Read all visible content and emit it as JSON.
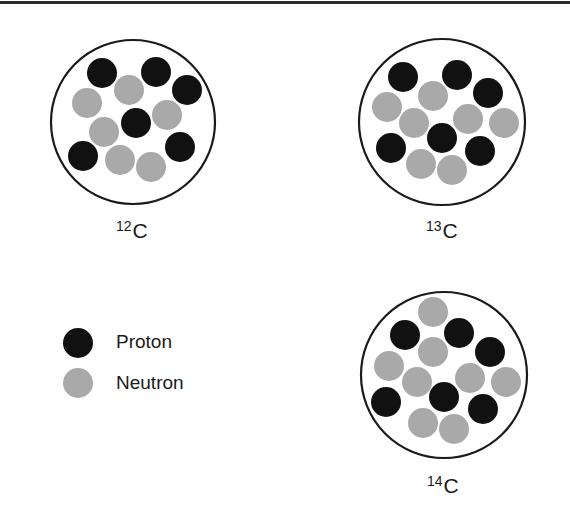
{
  "diagram": {
    "colors": {
      "proton": "#111111",
      "neutron": "#a9a9a9",
      "outline": "#1a1a1a",
      "rule": "#2a2a2a"
    },
    "nuclei": [
      {
        "id": "c12",
        "mass_number": "12",
        "symbol": "C",
        "protons": 6,
        "neutrons": 6,
        "center": [
          133,
          122
        ],
        "radius": 82,
        "particles": [
          {
            "type": "proton",
            "x": 102,
            "y": 73
          },
          {
            "type": "proton",
            "x": 156,
            "y": 72
          },
          {
            "type": "proton",
            "x": 187,
            "y": 90
          },
          {
            "type": "neutron",
            "x": 129,
            "y": 90
          },
          {
            "type": "neutron",
            "x": 87,
            "y": 103
          },
          {
            "type": "proton",
            "x": 136,
            "y": 123
          },
          {
            "type": "neutron",
            "x": 167,
            "y": 115
          },
          {
            "type": "neutron",
            "x": 104,
            "y": 132
          },
          {
            "type": "proton",
            "x": 83,
            "y": 156
          },
          {
            "type": "proton",
            "x": 180,
            "y": 147
          },
          {
            "type": "neutron",
            "x": 120,
            "y": 160
          },
          {
            "type": "neutron",
            "x": 151,
            "y": 167
          }
        ]
      },
      {
        "id": "c13",
        "mass_number": "13",
        "symbol": "C",
        "protons": 6,
        "neutrons": 7,
        "center": [
          442,
          122
        ],
        "radius": 83,
        "particles": [
          {
            "type": "proton",
            "x": 403,
            "y": 77
          },
          {
            "type": "proton",
            "x": 457,
            "y": 75
          },
          {
            "type": "proton",
            "x": 488,
            "y": 93
          },
          {
            "type": "neutron",
            "x": 433,
            "y": 96
          },
          {
            "type": "neutron",
            "x": 387,
            "y": 107
          },
          {
            "type": "neutron",
            "x": 414,
            "y": 123
          },
          {
            "type": "neutron",
            "x": 468,
            "y": 119
          },
          {
            "type": "neutron",
            "x": 504,
            "y": 123
          },
          {
            "type": "proton",
            "x": 442,
            "y": 138
          },
          {
            "type": "proton",
            "x": 391,
            "y": 148
          },
          {
            "type": "proton",
            "x": 480,
            "y": 151
          },
          {
            "type": "neutron",
            "x": 421,
            "y": 164
          },
          {
            "type": "neutron",
            "x": 452,
            "y": 170
          }
        ]
      },
      {
        "id": "c14",
        "mass_number": "14",
        "symbol": "C",
        "protons": 6,
        "neutrons": 8,
        "center": [
          444,
          375
        ],
        "radius": 83,
        "particles": [
          {
            "type": "neutron",
            "x": 433,
            "y": 312
          },
          {
            "type": "proton",
            "x": 405,
            "y": 335
          },
          {
            "type": "proton",
            "x": 459,
            "y": 333
          },
          {
            "type": "proton",
            "x": 490,
            "y": 352
          },
          {
            "type": "neutron",
            "x": 433,
            "y": 352
          },
          {
            "type": "neutron",
            "x": 389,
            "y": 366
          },
          {
            "type": "neutron",
            "x": 417,
            "y": 382
          },
          {
            "type": "neutron",
            "x": 470,
            "y": 378
          },
          {
            "type": "neutron",
            "x": 506,
            "y": 382
          },
          {
            "type": "proton",
            "x": 444,
            "y": 397
          },
          {
            "type": "proton",
            "x": 386,
            "y": 402
          },
          {
            "type": "proton",
            "x": 483,
            "y": 409
          },
          {
            "type": "neutron",
            "x": 423,
            "y": 423
          },
          {
            "type": "neutron",
            "x": 454,
            "y": 429
          }
        ]
      }
    ],
    "legend": {
      "items": [
        {
          "type": "proton",
          "label": "Proton"
        },
        {
          "type": "neutron",
          "label": "Neutron"
        }
      ]
    }
  }
}
